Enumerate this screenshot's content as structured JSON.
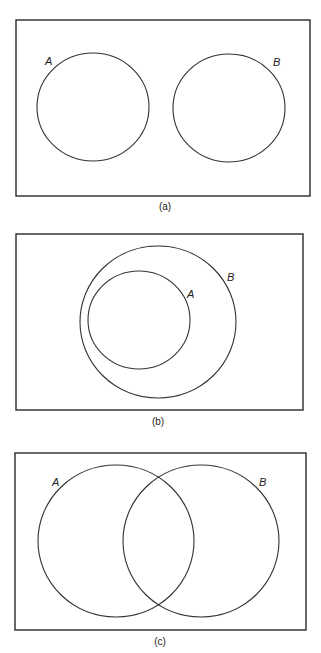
{
  "figure": {
    "panels": [
      {
        "caption": "(a)",
        "relation": "disjoint",
        "sets": [
          {
            "label": "A"
          },
          {
            "label": "B"
          }
        ]
      },
      {
        "caption": "(b)",
        "relation": "A subset of B",
        "sets": [
          {
            "label": "A"
          },
          {
            "label": "B"
          }
        ]
      },
      {
        "caption": "(c)",
        "relation": "overlapping",
        "sets": [
          {
            "label": "A"
          },
          {
            "label": "B"
          }
        ]
      }
    ]
  },
  "colors": {
    "stroke": "#333333",
    "background": "#ffffff"
  }
}
